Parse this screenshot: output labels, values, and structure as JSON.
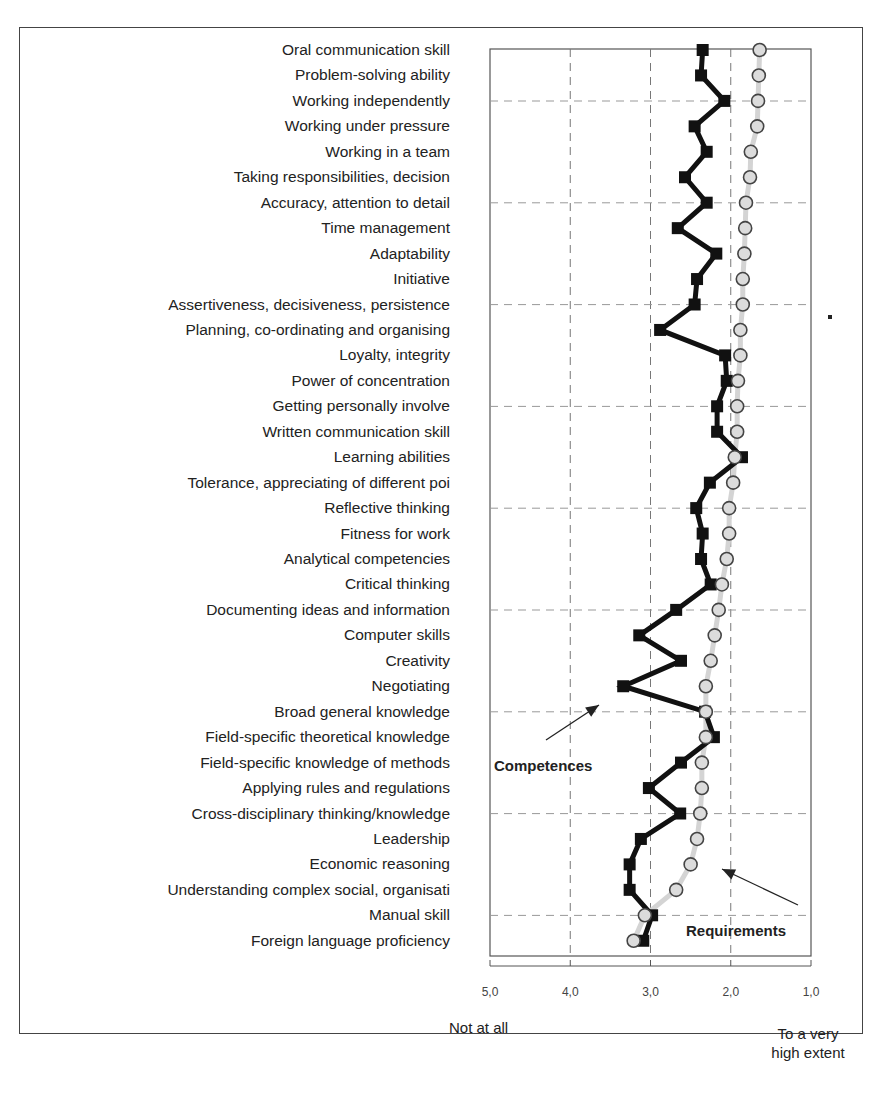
{
  "chart_data": {
    "type": "line",
    "orientation": "horizontal-categories-vertical",
    "title": "",
    "xlabel": "",
    "ylabel": "",
    "xlim": [
      5.0,
      1.0
    ],
    "x_reversed": true,
    "x_ticks": [
      "5,0",
      "4,0",
      "3,0",
      "2,0",
      "1,0"
    ],
    "x_tick_values": [
      5.0,
      4.0,
      3.0,
      2.0,
      1.0
    ],
    "scale_low_label": "Not at all",
    "scale_high_label_line1": "To a very",
    "scale_high_label_line2": "high extent",
    "grid": true,
    "legend": "annotations with arrows",
    "categories": [
      "Oral communication skill",
      "Problem-solving ability",
      "Working independently",
      "Working under pressure",
      "Working in a team",
      "Taking responsibilities, decision",
      "Accuracy, attention to detail",
      "Time management",
      "Adaptability",
      "Initiative",
      "Assertiveness, decisiveness, persistence",
      "Planning, co-ordinating and organising",
      "Loyalty, integrity",
      "Power of concentration",
      "Getting personally involve",
      "Written communication skill",
      "Learning abilities",
      "Tolerance, appreciating of different poi",
      "Reflective thinking",
      "Fitness for work",
      "Analytical competencies",
      "Critical thinking",
      "Documenting ideas and information",
      "Computer skills",
      "Creativity",
      "Negotiating",
      "Broad general knowledge",
      "Field-specific theoretical knowledge",
      "Field-specific knowledge of methods",
      "Applying rules and regulations",
      "Cross-disciplinary thinking/knowledge",
      "Leadership",
      "Economic reasoning",
      "Understanding complex social, organisati",
      "Manual skill",
      "Foreign language proficiency"
    ],
    "series": [
      {
        "name": "Competences",
        "marker": "square",
        "color": "#111111",
        "values": [
          2.35,
          2.37,
          2.08,
          2.45,
          2.3,
          2.57,
          2.3,
          2.66,
          2.18,
          2.42,
          2.45,
          2.88,
          2.07,
          2.05,
          2.17,
          2.17,
          1.86,
          2.26,
          2.43,
          2.35,
          2.37,
          2.25,
          2.68,
          3.14,
          2.62,
          3.34,
          2.32,
          2.21,
          2.62,
          3.02,
          2.63,
          3.12,
          3.26,
          3.26,
          2.98,
          3.09
        ]
      },
      {
        "name": "Requirements",
        "marker": "circle",
        "color": "#dddddd",
        "values": [
          1.64,
          1.65,
          1.66,
          1.67,
          1.75,
          1.76,
          1.81,
          1.82,
          1.83,
          1.85,
          1.85,
          1.88,
          1.88,
          1.91,
          1.92,
          1.92,
          1.95,
          1.97,
          2.02,
          2.02,
          2.05,
          2.11,
          2.15,
          2.2,
          2.25,
          2.31,
          2.31,
          2.31,
          2.36,
          2.36,
          2.38,
          2.42,
          2.5,
          2.68,
          3.07,
          3.21
        ]
      }
    ],
    "annotations": [
      {
        "text": "Competences",
        "arrow_to_value": 3.55,
        "arrow_to_row": 26
      },
      {
        "text": "Requirements",
        "arrow_to_value": 2.1,
        "arrow_to_row": 32.5
      }
    ]
  }
}
